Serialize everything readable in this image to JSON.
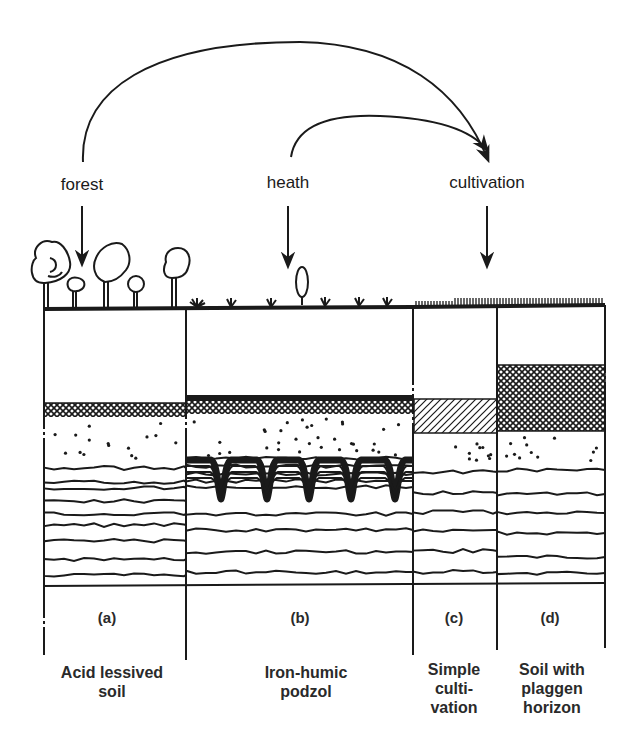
{
  "diagram": {
    "type": "soil-profile-comparison",
    "land_uses": [
      {
        "id": "forest",
        "label": "forest"
      },
      {
        "id": "heath",
        "label": "heath"
      },
      {
        "id": "cultivation",
        "label": "cultivation"
      }
    ],
    "transitions": [
      {
        "from": "forest",
        "to": "cultivation"
      },
      {
        "from": "heath",
        "to": "cultivation"
      }
    ],
    "profiles": [
      {
        "id": "a",
        "letter": "(a)",
        "name_lines": [
          "Acid lessived",
          "soil"
        ],
        "surface": "trees"
      },
      {
        "id": "b",
        "letter": "(b)",
        "name_lines": [
          "Iron-humic",
          "podzol"
        ],
        "surface": "heath shrubs"
      },
      {
        "id": "c",
        "letter": "(c)",
        "name_lines": [
          "Simple",
          "culti-",
          "vation"
        ],
        "surface": "crop stubble"
      },
      {
        "id": "d",
        "letter": "(d)",
        "name_lines": [
          "Soil with",
          "plaggen",
          "horizon"
        ],
        "surface": "crop stubble"
      }
    ],
    "legend_patterns": {
      "crosshatch": "humus / plaggen horizon",
      "diagonal_hatch": "plough layer",
      "dots": "eluvial sandy horizon",
      "wavy_lines": "stratified parent material",
      "black_band": "raw humus / iron pan"
    },
    "colors": {
      "ink": "#1a1a1a",
      "paper": "#ffffff"
    }
  }
}
